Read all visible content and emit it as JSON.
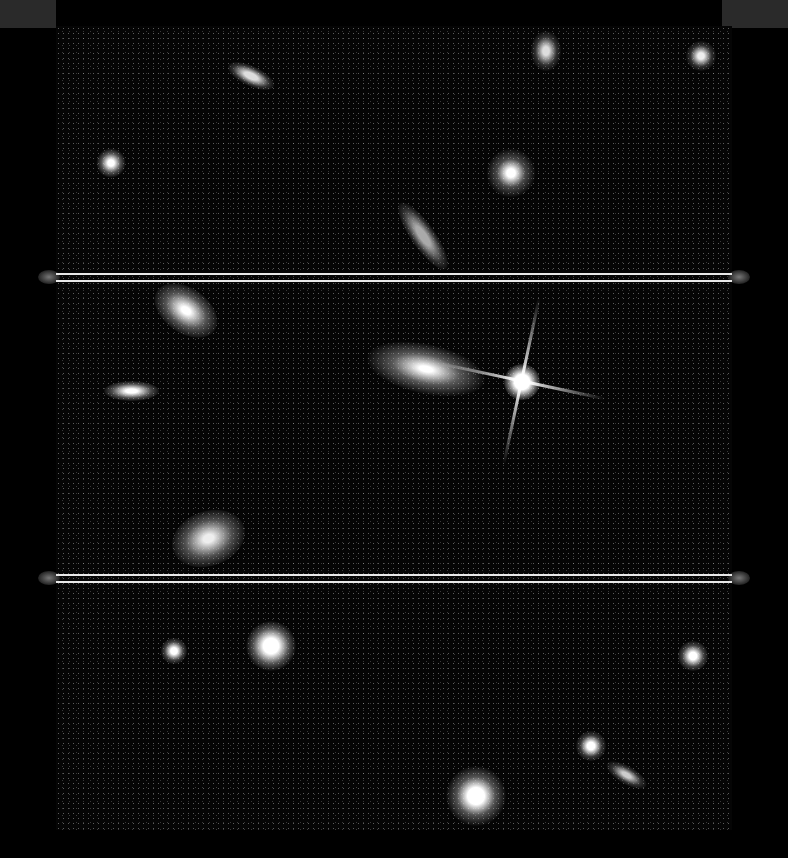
{
  "image": {
    "subject": "deep field astronomical image with galaxies and a bright star",
    "width": 788,
    "height": 858,
    "colors": {
      "background": "#000000",
      "separator": "#e8e8e8",
      "corner_block": "#2a2a2a"
    },
    "separators_y": [
      276,
      578
    ]
  }
}
